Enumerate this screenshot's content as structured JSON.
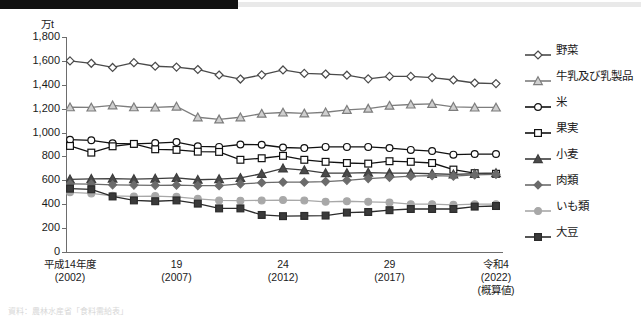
{
  "header": {
    "redacted_bar": true
  },
  "axis": {
    "unit_label": "万t",
    "y_ticks": [
      "1,800",
      "1,600",
      "1,400",
      "1,200",
      "1,000",
      "800",
      "600",
      "400",
      "200",
      "0"
    ],
    "x_labels": [
      {
        "era": "平成14年度",
        "year": "(2002)",
        "note": ""
      },
      {
        "era": "19",
        "year": "(2007)",
        "note": ""
      },
      {
        "era": "24",
        "year": "(2012)",
        "note": ""
      },
      {
        "era": "29",
        "year": "(2017)",
        "note": ""
      },
      {
        "era": "令和4",
        "year": "(2022)",
        "note": "(概算値)"
      }
    ]
  },
  "legend": {
    "items": [
      {
        "label": "野菜",
        "marker": "open-diamond",
        "color": "#4a4a4a",
        "fill": "#ffffff"
      },
      {
        "label": "牛乳及び乳製品",
        "marker": "open-triangle",
        "color": "#7d7d7d",
        "fill": "#cfcfcf"
      },
      {
        "label": "米",
        "marker": "open-circle",
        "color": "#111111",
        "fill": "#ffffff"
      },
      {
        "label": "果実",
        "marker": "open-square",
        "color": "#111111",
        "fill": "#ffffff"
      },
      {
        "label": "小麦",
        "marker": "filled-triangle",
        "color": "#3d3d3d",
        "fill": "#4a4a4a"
      },
      {
        "label": "肉類",
        "marker": "filled-diamond",
        "color": "#6b6b6b",
        "fill": "#6b6b6b"
      },
      {
        "label": "いも類",
        "marker": "filled-circle",
        "color": "#a8a8a8",
        "fill": "#a8a8a8"
      },
      {
        "label": "大豆",
        "marker": "filled-square",
        "color": "#2b2b2b",
        "fill": "#3a3a3a"
      }
    ]
  },
  "footnote": {
    "text": "資料：農林水産省「食料需給表」"
  },
  "chart_data": {
    "type": "line",
    "title": "",
    "xlabel": "",
    "ylabel": "万t",
    "ylim": [
      0,
      1800
    ],
    "ytick_step": 200,
    "grid": false,
    "legend_position": "right",
    "x": [
      2002,
      2003,
      2004,
      2005,
      2006,
      2007,
      2008,
      2009,
      2010,
      2011,
      2012,
      2013,
      2014,
      2015,
      2016,
      2017,
      2018,
      2019,
      2020,
      2021,
      2022
    ],
    "x_tick_values": [
      2002,
      2007,
      2012,
      2017,
      2022
    ],
    "series": [
      {
        "name": "野菜",
        "marker": "open-diamond",
        "color": "#4a4a4a",
        "fill": "#ffffff",
        "values": [
          1600,
          1580,
          1545,
          1585,
          1555,
          1548,
          1528,
          1482,
          1448,
          1483,
          1524,
          1495,
          1490,
          1480,
          1450,
          1470,
          1470,
          1460,
          1440,
          1415,
          1410
        ]
      },
      {
        "name": "牛乳及び乳製品",
        "marker": "open-triangle",
        "color": "#7d7d7d",
        "fill": "#cfcfcf",
        "values": [
          1212,
          1210,
          1228,
          1212,
          1210,
          1218,
          1128,
          1110,
          1128,
          1158,
          1168,
          1160,
          1170,
          1190,
          1200,
          1225,
          1235,
          1240,
          1215,
          1210,
          1210
        ]
      },
      {
        "name": "米",
        "marker": "open-circle",
        "color": "#111111",
        "fill": "#ffffff",
        "values": [
          940,
          935,
          910,
          905,
          912,
          920,
          885,
          880,
          900,
          898,
          875,
          870,
          880,
          880,
          880,
          870,
          855,
          845,
          815,
          820,
          820
        ]
      },
      {
        "name": "果実",
        "marker": "open-square",
        "color": "#111111",
        "fill": "#ffffff",
        "values": [
          888,
          832,
          885,
          905,
          860,
          855,
          840,
          838,
          772,
          785,
          805,
          772,
          755,
          745,
          740,
          760,
          755,
          745,
          690,
          660,
          655
        ]
      },
      {
        "name": "小麦",
        "marker": "filled-triangle",
        "color": "#3d3d3d",
        "fill": "#4a4a4a",
        "values": [
          608,
          612,
          615,
          610,
          615,
          620,
          605,
          610,
          620,
          655,
          700,
          685,
          660,
          660,
          665,
          660,
          660,
          655,
          650,
          655,
          660
        ]
      },
      {
        "name": "肉類",
        "marker": "filled-diamond",
        "color": "#6b6b6b",
        "fill": "#6b6b6b",
        "values": [
          570,
          568,
          562,
          560,
          558,
          560,
          555,
          555,
          570,
          580,
          585,
          585,
          590,
          600,
          615,
          625,
          635,
          640,
          635,
          645,
          650
        ]
      },
      {
        "name": "いも類",
        "marker": "filled-circle",
        "color": "#a8a8a8",
        "fill": "#a8a8a8",
        "values": [
          500,
          490,
          470,
          465,
          468,
          462,
          445,
          432,
          430,
          432,
          435,
          432,
          420,
          425,
          420,
          415,
          400,
          400,
          395,
          400,
          400
        ]
      },
      {
        "name": "大豆",
        "marker": "filled-square",
        "color": "#2b2b2b",
        "fill": "#3a3a3a",
        "values": [
          530,
          525,
          465,
          432,
          425,
          432,
          405,
          365,
          365,
          310,
          300,
          302,
          305,
          330,
          335,
          350,
          360,
          360,
          360,
          380,
          385
        ]
      }
    ]
  }
}
